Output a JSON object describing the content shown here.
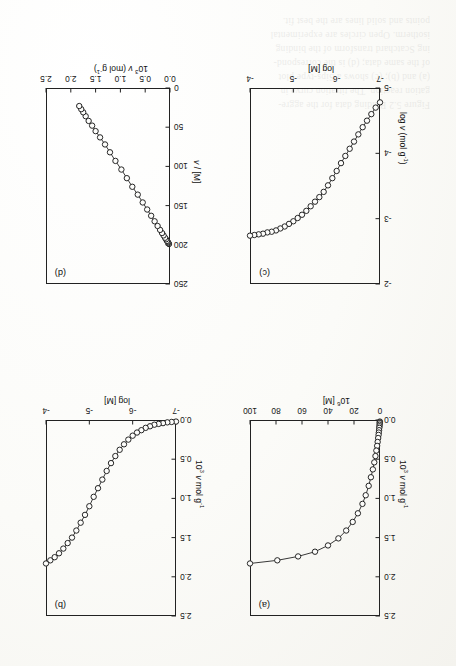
{
  "document": {
    "kind": "scanned-journal-figure-page",
    "orientation_note": "figure printed upside-down (180 deg) on the scanned page",
    "bleed_through_lines": [
      "Figure 5.2  Binding data for the aggre-",
      "gation reaction. The titration curve in",
      "(a) and (b); (c) shows a Sips-type plot",
      "of the same data; (d) is the correspond-",
      "ing Scatchard transform of the binding",
      "isotherm. Open circles are experimental",
      "points and solid lines are the best fit."
    ]
  },
  "figure": {
    "panels": [
      "a",
      "b",
      "c",
      "d"
    ]
  },
  "chart_data": [
    {
      "id": "a",
      "panel_label": "(a)",
      "type": "scatter",
      "title": "",
      "xlabel": "10⁶ [M]",
      "xlabel_parts": {
        "mantissa": "10",
        "exponent": "6",
        "rest": " [M]"
      },
      "ylabel": "10³ ν mol g⁻¹",
      "ylabel_parts": {
        "mantissa": "10",
        "exponent": "3",
        "rest": " ν mol g",
        "rest_exp": "-1"
      },
      "xlim": [
        0,
        100
      ],
      "ylim": [
        0,
        2.5
      ],
      "xticks": [
        0,
        20,
        40,
        60,
        80,
        100
      ],
      "xtick_labels": [
        "0",
        "20",
        "40",
        "60",
        "80",
        "100"
      ],
      "yticks": [
        0.0,
        0.5,
        1.0,
        1.5,
        2.0,
        2.5
      ],
      "ytick_labels": [
        "0.0",
        "0.5",
        "1.0",
        "1.5",
        "2.0",
        "2.5"
      ],
      "grid": false,
      "legend": "none",
      "line": true,
      "marker": "open-circle",
      "x": [
        0.1,
        0.15,
        0.2,
        0.3,
        0.4,
        0.55,
        0.7,
        0.9,
        1.1,
        1.4,
        1.8,
        2.2,
        2.8,
        3.5,
        4.4,
        5.5,
        7.0,
        8.7,
        11.0,
        13.5,
        17.0,
        21.0,
        26.0,
        32.0,
        40.0,
        50.0,
        63.0,
        79.0,
        100.0
      ],
      "y": [
        0.02,
        0.03,
        0.04,
        0.06,
        0.08,
        0.1,
        0.13,
        0.16,
        0.19,
        0.23,
        0.28,
        0.33,
        0.39,
        0.46,
        0.54,
        0.63,
        0.73,
        0.84,
        0.96,
        1.07,
        1.19,
        1.3,
        1.41,
        1.51,
        1.6,
        1.68,
        1.74,
        1.79,
        1.83
      ]
    },
    {
      "id": "b",
      "panel_label": "(b)",
      "type": "scatter",
      "title": "",
      "xlabel": "log [M]",
      "ylabel": "10³ ν mol g⁻¹",
      "ylabel_parts": {
        "mantissa": "10",
        "exponent": "3",
        "rest": " ν mol g",
        "rest_exp": "-1"
      },
      "xlim": [
        -7,
        -4
      ],
      "ylim": [
        0,
        2.5
      ],
      "xticks": [
        -7,
        -6,
        -5,
        -4
      ],
      "xtick_labels": [
        "-7",
        "-6",
        "-5",
        "-4"
      ],
      "yticks": [
        0.0,
        0.5,
        1.0,
        1.5,
        2.0,
        2.5
      ],
      "ytick_labels": [
        "0.0",
        "0.5",
        "1.0",
        "1.5",
        "2.0",
        "2.5"
      ],
      "grid": false,
      "legend": "none",
      "line": true,
      "marker": "open-circle",
      "x": [
        -7.0,
        -6.9,
        -6.8,
        -6.7,
        -6.6,
        -6.5,
        -6.4,
        -6.3,
        -6.2,
        -6.1,
        -6.0,
        -5.9,
        -5.8,
        -5.7,
        -5.6,
        -5.5,
        -5.4,
        -5.3,
        -5.2,
        -5.1,
        -5.0,
        -4.9,
        -4.8,
        -4.7,
        -4.6,
        -4.5,
        -4.4,
        -4.3,
        -4.2,
        -4.1,
        -4.0
      ],
      "y": [
        0.02,
        0.025,
        0.03,
        0.04,
        0.05,
        0.06,
        0.08,
        0.1,
        0.13,
        0.16,
        0.2,
        0.25,
        0.31,
        0.38,
        0.46,
        0.55,
        0.65,
        0.76,
        0.87,
        0.98,
        1.1,
        1.21,
        1.31,
        1.41,
        1.5,
        1.57,
        1.64,
        1.7,
        1.75,
        1.79,
        1.83
      ]
    },
    {
      "id": "c",
      "panel_label": "(c)",
      "type": "scatter",
      "title": "",
      "xlabel": "log [M]",
      "ylabel": "log ν (mol g⁻¹)",
      "ylabel_parts": {
        "head": "log ν (mol g",
        "rest_exp": "-1",
        "tail": ")"
      },
      "xlim": [
        -7,
        -4
      ],
      "ylim": [
        -5,
        -2
      ],
      "xticks": [
        -7,
        -6,
        -5,
        -4
      ],
      "xtick_labels": [
        "-7",
        "-6",
        "-5",
        "-4"
      ],
      "yticks": [
        -5,
        -4,
        -3,
        -2
      ],
      "ytick_labels": [
        "-5",
        "-4",
        "-3",
        "-2"
      ],
      "grid": false,
      "legend": "none",
      "line": true,
      "marker": "open-circle",
      "x": [
        -7.0,
        -6.9,
        -6.8,
        -6.7,
        -6.6,
        -6.5,
        -6.4,
        -6.3,
        -6.2,
        -6.1,
        -6.0,
        -5.9,
        -5.8,
        -5.7,
        -5.6,
        -5.5,
        -5.4,
        -5.3,
        -5.2,
        -5.1,
        -5.0,
        -4.9,
        -4.8,
        -4.7,
        -4.6,
        -4.5,
        -4.4,
        -4.3,
        -4.2,
        -4.1,
        -4.0
      ],
      "y": [
        -4.78,
        -4.7,
        -4.6,
        -4.5,
        -4.4,
        -4.29,
        -4.18,
        -4.07,
        -3.96,
        -3.85,
        -3.73,
        -3.62,
        -3.51,
        -3.41,
        -3.33,
        -3.26,
        -3.19,
        -3.12,
        -3.06,
        -3.01,
        -2.96,
        -2.92,
        -2.88,
        -2.85,
        -2.82,
        -2.8,
        -2.79,
        -2.77,
        -2.76,
        -2.75,
        -2.74
      ]
    },
    {
      "id": "d",
      "panel_label": "(d)",
      "type": "scatter",
      "title": "",
      "xlabel": "10³ ν (mol g⁻¹)",
      "xlabel_parts": {
        "mantissa": "10",
        "exponent": "3",
        "rest": " ν (mol g",
        "rest_exp": "-1",
        "tail": ")"
      },
      "ylabel": "ν / [M]",
      "xlim": [
        0.0,
        2.5
      ],
      "ylim": [
        0,
        250
      ],
      "xticks": [
        0.0,
        0.5,
        1.0,
        1.5,
        2.0,
        2.5
      ],
      "xtick_labels": [
        "0.0",
        "0.5",
        "1.0",
        "1.5",
        "2.0",
        "2.5"
      ],
      "yticks": [
        0,
        50,
        100,
        150,
        200,
        250
      ],
      "ytick_labels": [
        "0",
        "50",
        "100",
        "150",
        "200",
        "250"
      ],
      "grid": false,
      "legend": "none",
      "line": true,
      "marker": "open-circle",
      "x": [
        0.02,
        0.03,
        0.04,
        0.05,
        0.06,
        0.08,
        0.1,
        0.13,
        0.16,
        0.2,
        0.25,
        0.31,
        0.38,
        0.46,
        0.55,
        0.65,
        0.76,
        0.87,
        0.98,
        1.1,
        1.21,
        1.31,
        1.41,
        1.5,
        1.57,
        1.64,
        1.7,
        1.75,
        1.79,
        1.83
      ],
      "y": [
        199,
        198,
        197,
        196,
        195,
        193,
        191,
        188,
        185,
        181,
        176,
        170,
        163,
        155,
        146,
        136,
        126,
        115,
        104,
        93,
        82,
        72,
        63,
        55,
        48,
        42,
        36,
        31,
        27,
        23
      ]
    }
  ]
}
